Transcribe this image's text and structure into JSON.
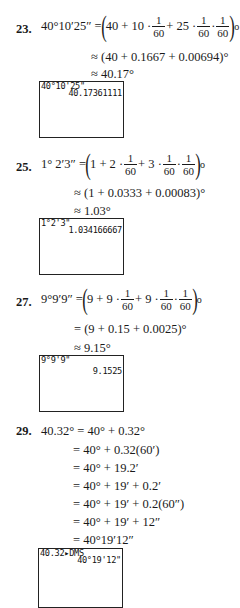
{
  "problems": [
    {
      "number": "23.",
      "lhs": "40°10′25″ =",
      "expr": {
        "a": "40 + 10 ·",
        "f1n": "1",
        "f1d": "60",
        "b": "+ 25 ·",
        "f2n": "1",
        "f2d": "60",
        "dot": "·",
        "f3n": "1",
        "f3d": "60",
        "deg": "o"
      },
      "steps": [
        "≈ (40 + 0.1667 + 0.00694)°",
        "≈ 40.17°"
      ],
      "calculator": {
        "input": "40°10'25\"",
        "output": "40.17361111"
      }
    },
    {
      "number": "25.",
      "lhs": "1° 2′3″ =",
      "expr": {
        "a": "1 + 2 ·",
        "f1n": "1",
        "f1d": "60",
        "b": "+ 3 ·",
        "f2n": "1",
        "f2d": "60",
        "dot": "·",
        "f3n": "1",
        "f3d": "60",
        "deg": "o"
      },
      "steps": [
        "≈ (1 + 0.0333 + 0.00083)°",
        "≈ 1.03°"
      ],
      "calculator": {
        "input": "1°2'3\"",
        "output": "1.034166667"
      }
    },
    {
      "number": "27.",
      "lhs": "9°9′9″ =",
      "expr": {
        "a": "9 + 9 ·",
        "f1n": "1",
        "f1d": "60",
        "b": "+ 9 ·",
        "f2n": "1",
        "f2d": "60",
        "dot": "·",
        "f3n": "1",
        "f3d": "60",
        "deg": "o"
      },
      "steps": [
        "= (9 + 0.15 + 0.0025)°",
        "≈ 9.15°"
      ],
      "calculator": {
        "input": "9°9'9\"",
        "output": "9.1525"
      }
    },
    {
      "number": "29.",
      "lhs": "40.32° = 40° + 0.32°",
      "steps": [
        "= 40° + 0.32(60′)",
        "= 40° + 19.2′",
        "= 40° + 19′ + 0.2′",
        "= 40° + 19′ + 0.2(60″)",
        "= 40° + 19′ + 12″",
        "= 40°19′12″"
      ],
      "calculator": {
        "input": "40.32▸DMS",
        "output": "40°19'12\""
      }
    }
  ]
}
